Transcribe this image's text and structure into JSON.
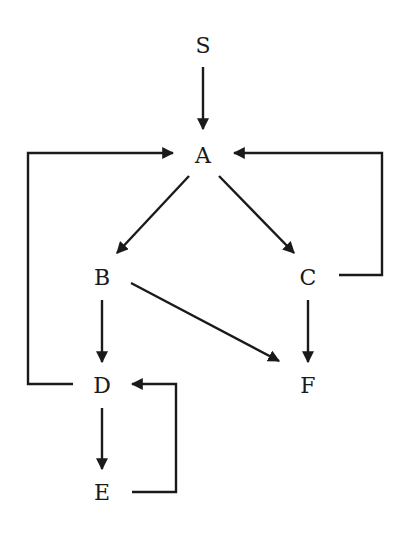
{
  "diagram": {
    "type": "directed-graph",
    "nodes": [
      {
        "id": "S",
        "label": "S",
        "x": 203,
        "y": 45
      },
      {
        "id": "A",
        "label": "A",
        "x": 203,
        "y": 155
      },
      {
        "id": "B",
        "label": "B",
        "x": 102,
        "y": 277
      },
      {
        "id": "C",
        "label": "C",
        "x": 308,
        "y": 277
      },
      {
        "id": "D",
        "label": "D",
        "x": 102,
        "y": 385
      },
      {
        "id": "F",
        "label": "F",
        "x": 308,
        "y": 385
      },
      {
        "id": "E",
        "label": "E",
        "x": 102,
        "y": 492
      }
    ],
    "edges": [
      {
        "from": "S",
        "to": "A"
      },
      {
        "from": "A",
        "to": "B"
      },
      {
        "from": "A",
        "to": "C"
      },
      {
        "from": "B",
        "to": "D"
      },
      {
        "from": "B",
        "to": "F"
      },
      {
        "from": "C",
        "to": "F"
      },
      {
        "from": "C",
        "to": "A"
      },
      {
        "from": "D",
        "to": "A"
      },
      {
        "from": "D",
        "to": "E"
      },
      {
        "from": "E",
        "to": "D"
      }
    ],
    "colors": {
      "stroke": "#1a1a1a",
      "background": "#ffffff"
    }
  }
}
